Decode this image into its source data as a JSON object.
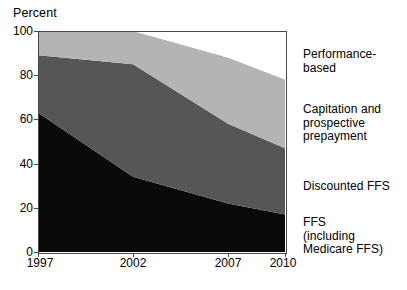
{
  "chart_data": {
    "type": "area",
    "title": "",
    "subtitle": "",
    "xlabel": "",
    "ylabel": "Percent",
    "stacked": true,
    "grid": false,
    "legend_position": "right-inline",
    "xlim": [
      1997,
      2010
    ],
    "ylim": [
      0,
      100
    ],
    "x": [
      1997,
      2002,
      2007,
      2010
    ],
    "xtick_labels": [
      "1997",
      "2002",
      "2007",
      "2010"
    ],
    "ytick_labels": [
      "0",
      "20",
      "40",
      "60",
      "80",
      "100"
    ],
    "ytick_values": [
      0,
      20,
      40,
      60,
      80,
      100
    ],
    "series": [
      {
        "name": "FFS (including Medicare FFS)",
        "label_text": "FFS\n(including\nMedicare FFS)",
        "color": "#0a0a0a",
        "values": [
          63,
          34,
          22,
          17
        ]
      },
      {
        "name": "Discounted FFS",
        "label_text": "Discounted FFS",
        "color": "#565656",
        "values": [
          26,
          51,
          36,
          30
        ]
      },
      {
        "name": "Capitation and prospective prepayment",
        "label_text": "Capitation and\nprospective\nprepayment",
        "color": "#b4b4b4",
        "values": [
          11,
          15,
          30,
          31
        ]
      },
      {
        "name": "Performance-based",
        "label_text": "Performance-based",
        "color": "#ffffff",
        "values": [
          0,
          0,
          12,
          22
        ]
      }
    ],
    "cumulative_tops": {
      "ffs": [
        63,
        34,
        22,
        17
      ],
      "discounted_ffs": [
        89,
        85,
        58,
        47
      ],
      "capitation": [
        100,
        100,
        88,
        78
      ],
      "performance_based": [
        100,
        100,
        100,
        100
      ]
    }
  },
  "axis": {
    "y_title": "Percent",
    "y_ticks": [
      "100",
      "80",
      "60",
      "40",
      "20",
      "0"
    ],
    "x_ticks": [
      "1997",
      "2002",
      "2007",
      "2010"
    ]
  },
  "labels": {
    "performance_based": "Performance-based",
    "capitation": "Capitation and\nprospective\nprepayment",
    "discounted_ffs": "Discounted FFS",
    "ffs": "FFS\n(including\nMedicare FFS)"
  },
  "colors": {
    "ffs": "#0a0a0a",
    "discounted_ffs": "#565656",
    "capitation": "#b4b4b4",
    "performance_based": "#ffffff",
    "frame": "#4a4a4a",
    "text": "#000000",
    "background": "#ffffff"
  }
}
